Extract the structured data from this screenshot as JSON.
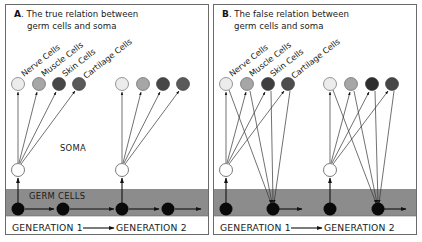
{
  "colors": {
    "band": "#8c8c8c",
    "border": "#6a6a6a",
    "nerve_cell": "#ececec",
    "muscle_cell": "#a6a6a6",
    "skin_cell": "#4a4a4a",
    "cartilage_cell": "#5a5a5a",
    "soma_stem": "#ffffff",
    "germ_cell": "#0a0a0a"
  },
  "panels": [
    {
      "id": "A",
      "letter": "A",
      "title_line1": ". The true relation between",
      "title_line2": "germ cells and soma",
      "cell_labels": [
        "Nerve Cells",
        "Muscle Cells",
        "Skin Cells",
        "Cartilage Cells"
      ],
      "soma_label": "SOMA",
      "band_label": "GERM CELLS",
      "generation_1": "GENERATION 1",
      "generation_2": "GENERATION 2"
    },
    {
      "id": "B",
      "letter": "B",
      "title_line1": ". The false relation between",
      "title_line2": "germ cells and soma",
      "cell_labels": [
        "Nerve Cells",
        "Muscle Cells",
        "Skin Cells",
        "Cartilage Cells"
      ],
      "generation_1": "GENERATION 1",
      "generation_2": "GENERATION 2"
    }
  ]
}
